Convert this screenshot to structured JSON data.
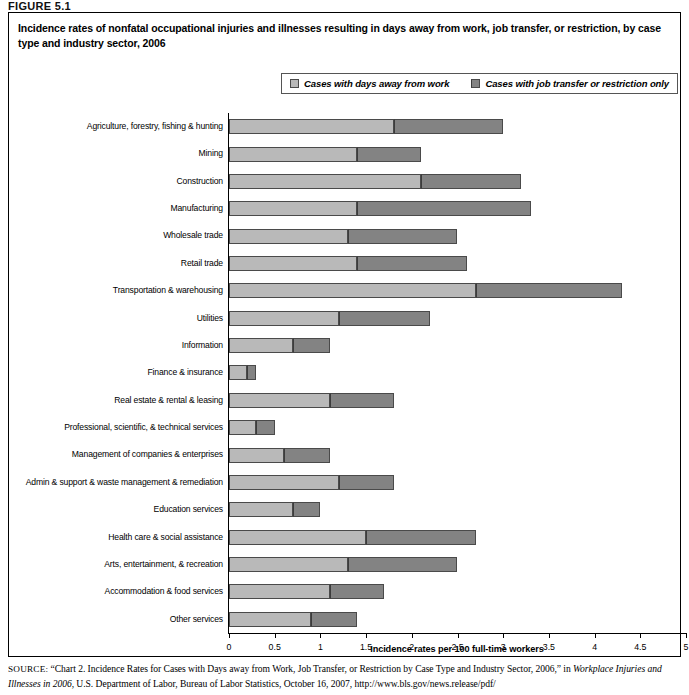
{
  "figure": {
    "label": "FIGURE 5.1",
    "title": "Incidence rates of nonfatal occupational injuries and illnesses resulting in days away from work, job transfer, or restriction, by case type and industry sector, 2006"
  },
  "legend": {
    "position": "top-center",
    "entries": [
      {
        "label": "Cases with days away from work",
        "color": "#b9b9b9"
      },
      {
        "label": "Cases with job transfer or restriction only",
        "color": "#838383"
      }
    ]
  },
  "source": {
    "prefix": "SOURCE:",
    "line1": " “Chart 2. Incidence Rates for Cases with Days away from Work, Job Transfer, or Restriction by Case Type and Industry Sector, 2006,” in ",
    "italic": "Workplace Injuries and Illnesses in 2006",
    "line2": ", U.S. Department of Labor, Bureau of Labor Statistics, October 16, 2007, http://www.bls.gov/news.release/pdf/"
  },
  "chart_data": {
    "type": "bar",
    "orientation": "horizontal",
    "stacked": true,
    "title": "Incidence rates of nonfatal occupational injuries and illnesses resulting in days away from work, job transfer, or restriction, by case type and industry sector, 2006",
    "xlabel": "Incidence rates per 100 full-time workers",
    "ylabel": "",
    "xlim": [
      0,
      5
    ],
    "xticks": [
      0,
      0.5,
      1,
      1.5,
      2,
      2.5,
      3,
      3.5,
      4,
      4.5,
      5
    ],
    "xtick_labels": [
      "0",
      "0.5",
      "1",
      "1.5",
      "2",
      "2.5",
      "3",
      "3.5",
      "4",
      "4.5",
      "5"
    ],
    "grid": false,
    "categories": [
      "Agriculture, forestry, fishing & hunting",
      "Mining",
      "Construction",
      "Manufacturing",
      "Wholesale trade",
      "Retail trade",
      "Transportation & warehousing",
      "Utilities",
      "Information",
      "Finance & insurance",
      "Real estate & rental & leasing",
      "Professional, scientific, & technical services",
      "Management of companies & enterprises",
      "Admin & support & waste management & remediation",
      "Education services",
      "Health care & social assistance",
      "Arts, entertainment, & recreation",
      "Accommodation & food services",
      "Other services"
    ],
    "series": [
      {
        "name": "Cases with days away from work",
        "color": "#b9b9b9",
        "values": [
          1.8,
          1.4,
          2.1,
          1.4,
          1.3,
          1.4,
          2.7,
          1.2,
          0.7,
          0.2,
          1.1,
          0.3,
          0.6,
          1.2,
          0.7,
          1.5,
          1.3,
          1.1,
          0.9
        ]
      },
      {
        "name": "Cases with job transfer or restriction only",
        "color": "#838383",
        "values": [
          1.2,
          0.7,
          1.1,
          1.9,
          1.2,
          1.2,
          1.6,
          1.0,
          0.4,
          0.1,
          0.7,
          0.2,
          0.5,
          0.6,
          0.3,
          1.2,
          1.2,
          0.6,
          0.5
        ]
      }
    ],
    "totals": [
      3.0,
      2.1,
      3.2,
      3.3,
      2.5,
      2.6,
      4.3,
      2.2,
      1.1,
      0.3,
      1.8,
      0.5,
      1.1,
      1.8,
      1.0,
      2.7,
      2.5,
      1.7,
      1.4
    ]
  }
}
